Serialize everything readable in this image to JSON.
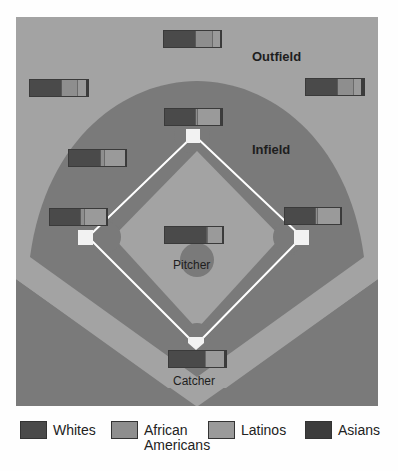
{
  "labels": {
    "outfield": "Outfield",
    "infield": "Infield",
    "pitcher": "Pitcher",
    "catcher": "Catcher"
  },
  "legend": [
    {
      "label": "Whites",
      "color": "#4a4a4a"
    },
    {
      "label": "African Americans",
      "color": "#8e8e8e"
    },
    {
      "label": "Latinos",
      "color": "#9a9a9a"
    },
    {
      "label": "Asians",
      "color": "#3c3c3c"
    }
  ],
  "colors": {
    "outfield": "#a3a3a3",
    "infield_dirt": "#7a7a7a",
    "infield_grass": "#a3a3a3",
    "foul": "#7a7a7a",
    "base": "#f2f2f2",
    "baseline": "#ffffff"
  },
  "chart_data": {
    "type": "bar",
    "title": "",
    "stacked": true,
    "categories": [
      "Center field",
      "Left field",
      "Right field",
      "Second base",
      "Shortstop",
      "Third base",
      "First base",
      "Pitcher",
      "Catcher"
    ],
    "series": [
      {
        "name": "Whites",
        "values": [
          55,
          53,
          53,
          53,
          55,
          52,
          54,
          70,
          64
        ]
      },
      {
        "name": "African Americans",
        "values": [
          29,
          28,
          28,
          4,
          6,
          8,
          4,
          3,
          0
        ]
      },
      {
        "name": "Latinos",
        "values": [
          14,
          15,
          14,
          40,
          38,
          38,
          40,
          25,
          33
        ]
      },
      {
        "name": "Asians",
        "values": [
          2,
          4,
          5,
          3,
          1,
          2,
          2,
          2,
          3
        ]
      }
    ],
    "xlabel": "",
    "ylabel": "",
    "legend_position": "bottom"
  },
  "positions": [
    {
      "name": "center-field",
      "x": 147,
      "y": 13,
      "w": 59,
      "segs": [
        55,
        29,
        14,
        2
      ]
    },
    {
      "name": "left-field",
      "x": 13,
      "y": 62,
      "w": 60,
      "segs": [
        53,
        28,
        15,
        4
      ]
    },
    {
      "name": "right-field",
      "x": 289,
      "y": 61,
      "w": 60,
      "segs": [
        53,
        28,
        14,
        5
      ]
    },
    {
      "name": "second-base",
      "x": 148,
      "y": 91,
      "w": 59,
      "segs": [
        53,
        4,
        40,
        3
      ]
    },
    {
      "name": "shortstop",
      "x": 52,
      "y": 132,
      "w": 59,
      "segs": [
        55,
        6,
        38,
        1
      ]
    },
    {
      "name": "third-base",
      "x": 33,
      "y": 191,
      "w": 59,
      "segs": [
        52,
        8,
        38,
        2
      ]
    },
    {
      "name": "first-base",
      "x": 268,
      "y": 190,
      "w": 58,
      "segs": [
        54,
        4,
        40,
        2
      ]
    },
    {
      "name": "pitcher",
      "x": 148,
      "y": 209,
      "w": 60,
      "segs": [
        70,
        3,
        25,
        2
      ]
    },
    {
      "name": "catcher",
      "x": 152,
      "y": 333,
      "w": 59,
      "segs": [
        64,
        0,
        33,
        3
      ]
    }
  ]
}
